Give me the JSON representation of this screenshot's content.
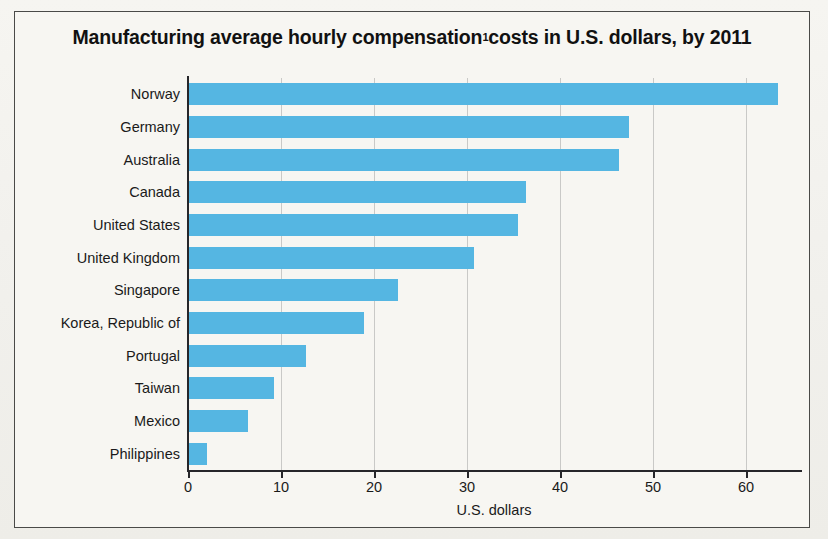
{
  "figure": {
    "title_text": "Manufacturing average hourly compensation",
    "title_superscript": "1",
    "title_tail": " costs in U.S. dollars, by 2011",
    "background_color": "#f4f3ef",
    "frame_color": "#4a4a48",
    "bar_color": "#55b6e2",
    "gridline_color": "#c9c9c7",
    "axis_color": "#26262a"
  },
  "chart_data": {
    "type": "bar",
    "orientation": "horizontal",
    "xlabel": "U.S. dollars",
    "ylabel": "",
    "xlim": [
      0,
      65.8
    ],
    "xticks": [
      0,
      10,
      20,
      30,
      40,
      50,
      60
    ],
    "xticklabels": [
      "0",
      "10",
      "20",
      "30",
      "40",
      "50",
      "60"
    ],
    "grid": "vertical",
    "legend": "none",
    "categories": [
      "Norway",
      "Germany",
      "Australia",
      "Canada",
      "United States",
      "United Kingdom",
      "Singapore",
      "Korea, Republic of",
      "Portugal",
      "Taiwan",
      "Mexico",
      "Philippines"
    ],
    "values": [
      63.4,
      47.4,
      46.3,
      36.3,
      35.5,
      30.8,
      22.6,
      18.9,
      12.7,
      9.3,
      6.5,
      2.0
    ],
    "series": [
      {
        "name": "Hourly compensation (USD)",
        "values": [
          63.4,
          47.4,
          46.3,
          36.3,
          35.5,
          30.8,
          22.6,
          18.9,
          12.7,
          9.3,
          6.5,
          2.0
        ]
      }
    ]
  }
}
